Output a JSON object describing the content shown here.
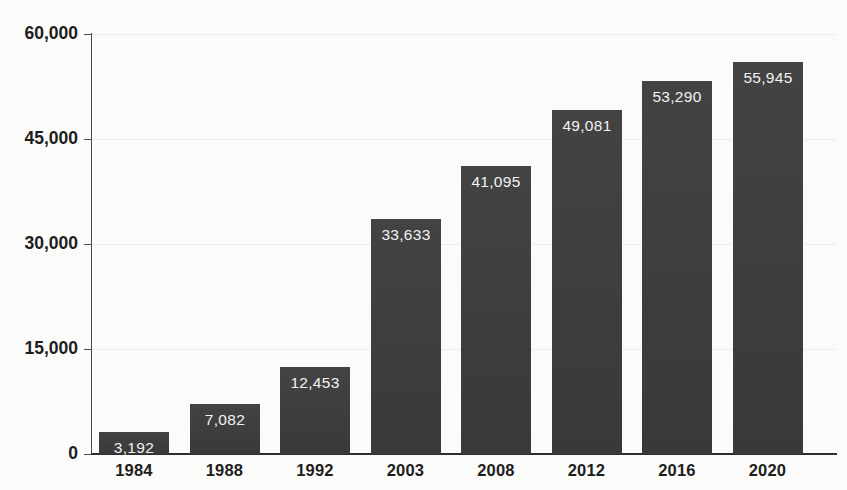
{
  "chart_data": {
    "type": "bar",
    "title": "",
    "subtitle": "",
    "xlabel": "",
    "ylabel": "",
    "categories": [
      "1984",
      "1988",
      "1992",
      "2003",
      "2008",
      "2012",
      "2016",
      "2020"
    ],
    "values": [
      3192,
      7082,
      12453,
      33633,
      41095,
      49081,
      53290,
      55945
    ],
    "value_labels": [
      "3,192",
      "7,082",
      "12,453",
      "33,633",
      "41,095",
      "49,081",
      "53,290",
      "55,945"
    ],
    "ylim": [
      0,
      60000
    ],
    "yticks": [
      0,
      15000,
      30000,
      45000,
      60000
    ],
    "ytick_labels": [
      "0",
      "15,000",
      "30,000",
      "45,000",
      "60,000"
    ],
    "grid": true,
    "legend": null,
    "legend_position": "none",
    "bar_color": "#3c3c3c",
    "value_label_color": "#f2f2f2",
    "axis_color": "#2e2e2e",
    "gridline_color": "#ececeb",
    "background_color": "#fbfbfa"
  }
}
